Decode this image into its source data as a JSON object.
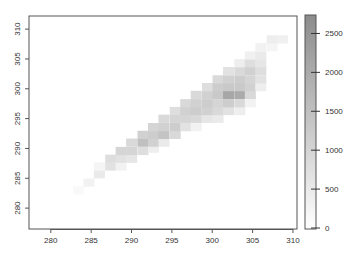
{
  "chart_data": {
    "type": "heatmap",
    "title": "",
    "xlabel": "",
    "ylabel": "",
    "xlim": [
      277.3,
      310.5
    ],
    "ylim": [
      276.5,
      312.2
    ],
    "x_ticks": [
      280,
      285,
      290,
      295,
      300,
      305,
      310
    ],
    "y_ticks": [
      280,
      285,
      290,
      295,
      300,
      305,
      310
    ],
    "colorbar": {
      "ticks": [
        0,
        500,
        1000,
        1500,
        2000,
        2500
      ],
      "range": [
        0,
        2750
      ],
      "low_color": "#ffffff",
      "high_color": "#8c8c8c"
    },
    "bin_width": 1.33,
    "bin_height": 1.33,
    "cells": [
      [
        283.4,
        283.0,
        150
      ],
      [
        284.7,
        284.3,
        300
      ],
      [
        286.0,
        285.7,
        500
      ],
      [
        286.0,
        287.0,
        250
      ],
      [
        287.4,
        287.0,
        700
      ],
      [
        287.4,
        288.3,
        800
      ],
      [
        288.7,
        287.0,
        300
      ],
      [
        288.7,
        288.3,
        700
      ],
      [
        288.7,
        289.6,
        1000
      ],
      [
        290.0,
        288.3,
        600
      ],
      [
        290.0,
        289.6,
        1000
      ],
      [
        290.0,
        291.0,
        900
      ],
      [
        291.4,
        289.6,
        800
      ],
      [
        291.4,
        291.0,
        1500
      ],
      [
        291.4,
        292.3,
        1100
      ],
      [
        292.7,
        290.0,
        400
      ],
      [
        292.7,
        291.0,
        1100
      ],
      [
        292.7,
        292.3,
        1200
      ],
      [
        292.7,
        293.6,
        1000
      ],
      [
        294.0,
        291.0,
        500
      ],
      [
        294.0,
        292.3,
        1400
      ],
      [
        294.0,
        293.6,
        1100
      ],
      [
        294.0,
        295.0,
        900
      ],
      [
        295.4,
        292.3,
        900
      ],
      [
        295.4,
        293.6,
        1200
      ],
      [
        295.4,
        295.0,
        1000
      ],
      [
        295.4,
        296.3,
        800
      ],
      [
        296.7,
        293.6,
        700
      ],
      [
        296.7,
        295.0,
        1000
      ],
      [
        296.7,
        296.3,
        1100
      ],
      [
        296.7,
        297.6,
        900
      ],
      [
        298.0,
        293.6,
        300
      ],
      [
        298.0,
        295.0,
        900
      ],
      [
        298.0,
        296.3,
        1200
      ],
      [
        298.0,
        297.6,
        1100
      ],
      [
        298.0,
        299.0,
        900
      ],
      [
        299.4,
        295.0,
        600
      ],
      [
        299.4,
        296.3,
        1100
      ],
      [
        299.4,
        297.6,
        1200
      ],
      [
        299.4,
        299.0,
        1100
      ],
      [
        299.4,
        300.3,
        800
      ],
      [
        300.7,
        295.0,
        500
      ],
      [
        300.7,
        296.3,
        900
      ],
      [
        300.7,
        297.6,
        1000
      ],
      [
        300.7,
        299.0,
        1300
      ],
      [
        300.7,
        300.3,
        1200
      ],
      [
        300.7,
        301.6,
        900
      ],
      [
        302.0,
        296.3,
        700
      ],
      [
        302.0,
        297.6,
        1200
      ],
      [
        302.0,
        299.0,
        2100
      ],
      [
        302.0,
        300.3,
        1300
      ],
      [
        302.0,
        301.6,
        1100
      ],
      [
        302.0,
        303.0,
        700
      ],
      [
        303.4,
        296.3,
        400
      ],
      [
        303.4,
        297.6,
        900
      ],
      [
        303.4,
        299.0,
        2000
      ],
      [
        303.4,
        300.3,
        1300
      ],
      [
        303.4,
        301.6,
        1200
      ],
      [
        303.4,
        303.0,
        900
      ],
      [
        303.4,
        304.3,
        400
      ],
      [
        304.7,
        297.6,
        300
      ],
      [
        304.7,
        299.0,
        900
      ],
      [
        304.7,
        300.3,
        1100
      ],
      [
        304.7,
        301.6,
        1000
      ],
      [
        304.7,
        303.0,
        1100
      ],
      [
        304.7,
        304.3,
        800
      ],
      [
        304.7,
        305.6,
        350
      ],
      [
        306.0,
        300.3,
        400
      ],
      [
        306.0,
        301.6,
        700
      ],
      [
        306.0,
        303.0,
        800
      ],
      [
        306.0,
        304.3,
        600
      ],
      [
        306.0,
        305.6,
        500
      ],
      [
        306.0,
        307.0,
        300
      ],
      [
        307.4,
        307.0,
        250
      ],
      [
        307.4,
        308.3,
        400
      ],
      [
        308.7,
        308.3,
        350
      ]
    ]
  }
}
